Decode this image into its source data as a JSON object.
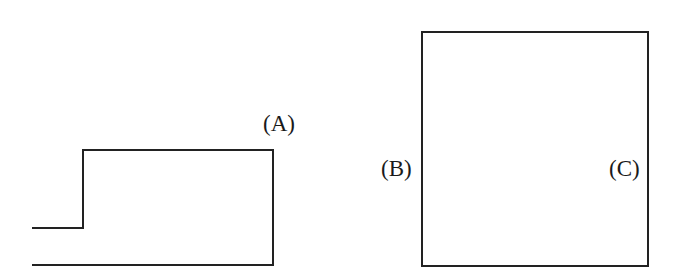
{
  "figure": {
    "background_color": "#ffffff",
    "stroke_color": "#222222",
    "stroke_width": 2,
    "width": 675,
    "height": 279,
    "labels": {
      "a": "(A)",
      "b": "(B)",
      "c": "(C)"
    },
    "shapes": {
      "step_profile": {
        "name": "step-profile-outline",
        "points": "33,228 83,228 83,150 273,150 273,265",
        "baseline": "33,265 273,265"
      },
      "square": {
        "name": "square-outline",
        "x": 422,
        "y": 32,
        "width": 226,
        "height": 234
      }
    }
  }
}
